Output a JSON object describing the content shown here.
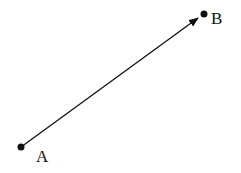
{
  "diagram": {
    "points": [
      {
        "id": "A",
        "label": "A",
        "x": 21,
        "y": 147
      },
      {
        "id": "B",
        "label": "B",
        "x": 204,
        "y": 14
      }
    ],
    "vector": {
      "from": "A",
      "to": "B"
    },
    "colors": {
      "stroke": "#111111",
      "background": "#ffffff"
    }
  }
}
